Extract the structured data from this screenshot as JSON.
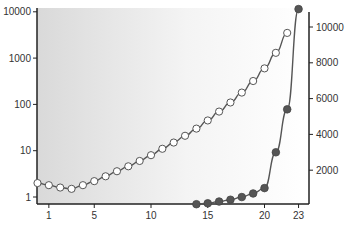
{
  "chart_data": {
    "type": "line",
    "title": "",
    "xlabel": "",
    "ylabel_left": "",
    "ylabel_right": "",
    "x_ticks": [
      1,
      5,
      10,
      15,
      20,
      23
    ],
    "y_left_scale": "log",
    "y_left_ticks": [
      1,
      10,
      100,
      1000,
      10000
    ],
    "y_left_tick_labels": [
      "1",
      "10",
      "100",
      "1000",
      "10000"
    ],
    "y_right_ticks": [
      2000,
      4000,
      6000,
      8000,
      10000
    ],
    "y_right_tick_labels": [
      "2000",
      "4000",
      "6000",
      "8000",
      "10000"
    ],
    "ylim_left": [
      0.85,
      10000
    ],
    "ylim_right": [
      0,
      11000
    ],
    "grid": false,
    "series": [
      {
        "name": "log scale (open circles)",
        "axis": "left",
        "marker": "open-circle",
        "x": [
          0,
          1,
          2,
          3,
          4,
          5,
          6,
          7,
          8,
          9,
          10,
          11,
          12,
          13,
          14,
          15,
          16,
          17,
          18,
          19,
          20,
          21,
          22
        ],
        "values": [
          2.0,
          1.8,
          1.6,
          1.5,
          1.8,
          2.2,
          2.8,
          3.6,
          4.6,
          6,
          8,
          11,
          15,
          21,
          30,
          45,
          70,
          110,
          180,
          320,
          600,
          1300,
          3500
        ]
      },
      {
        "name": "linear scale (filled circles)",
        "axis": "right",
        "marker": "filled-circle",
        "x": [
          14,
          15,
          16,
          17,
          18,
          19,
          20,
          21,
          22,
          23
        ],
        "values": [
          100,
          150,
          250,
          350,
          500,
          700,
          1000,
          3000,
          5400,
          11000
        ]
      }
    ]
  }
}
